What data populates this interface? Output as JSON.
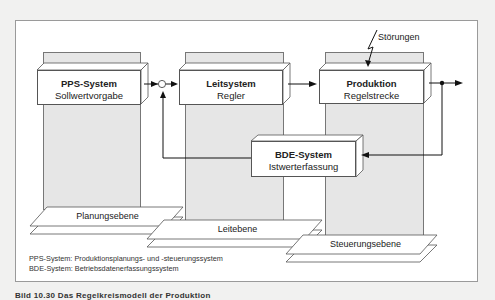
{
  "diagram": {
    "blocks": [
      {
        "id": "pps",
        "title": "PPS-System",
        "subtitle": "Sollwertvorgabe"
      },
      {
        "id": "leit",
        "title": "Leitsystem",
        "subtitle": "Regler"
      },
      {
        "id": "prod",
        "title": "Produktion",
        "subtitle": "Regelstrecke"
      },
      {
        "id": "bde",
        "title": "BDE-System",
        "subtitle": "Istwerterfassung"
      }
    ],
    "disturbance_label": "Störungen",
    "planes": [
      {
        "label": "Planungsebene"
      },
      {
        "label": "Leitebene"
      },
      {
        "label": "Steuerungsebene"
      }
    ],
    "legend": [
      "PPS-System: Produktionsplanungs- und -steuerungssystem",
      "BDE-System: Betriebsdatenerfassungssystem"
    ],
    "caption": "Bild 10.30 Das Regelkreismodell der Produktion"
  }
}
